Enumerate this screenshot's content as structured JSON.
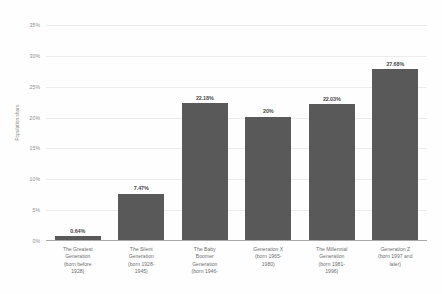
{
  "chart_data": {
    "type": "bar",
    "title": "",
    "subtitle": "",
    "xlabel": "",
    "ylabel": "Population share",
    "ylim": [
      0,
      35
    ],
    "grid": true,
    "legend": "none",
    "orientation": "vertical",
    "bar_color": "#595959",
    "gridline_color": "#ececec",
    "background_color": "#ffffff",
    "y_ticks": [
      "0%",
      "5%",
      "10%",
      "15%",
      "20%",
      "25%",
      "30%",
      "35%"
    ],
    "y_tick_values": [
      0,
      5,
      10,
      15,
      20,
      25,
      30,
      35
    ],
    "categories": [
      "The Greatest Generation (born before 1928)",
      "The Silent Generation (born 1928-1945)",
      "The Baby Boomer Generation (born 1946-",
      "Generation X (born 1965-1980)",
      "The Millennial Generation (born 1981-1996)",
      "Generation Z (born 1997 and later)"
    ],
    "category_lines": [
      [
        "The Greatest",
        "Generation",
        "(born before",
        "1928)"
      ],
      [
        "The Silent",
        "Generation",
        "(born 1928-",
        "1945)"
      ],
      [
        "The Baby",
        "Boomer",
        "Generation",
        "(born 1946-"
      ],
      [
        "Generation X",
        "(born 1965-",
        "1980)"
      ],
      [
        "The Millennial",
        "Generation",
        "(born 1981-",
        "1996)"
      ],
      [
        "Generation Z",
        "(born 1997 and",
        "later)"
      ]
    ],
    "values": [
      0.64,
      7.47,
      22.18,
      20,
      22.03,
      27.68
    ],
    "value_labels": [
      "0.64%",
      "7.47%",
      "22.18%",
      "20%",
      "22.03%",
      "27.68%"
    ]
  }
}
